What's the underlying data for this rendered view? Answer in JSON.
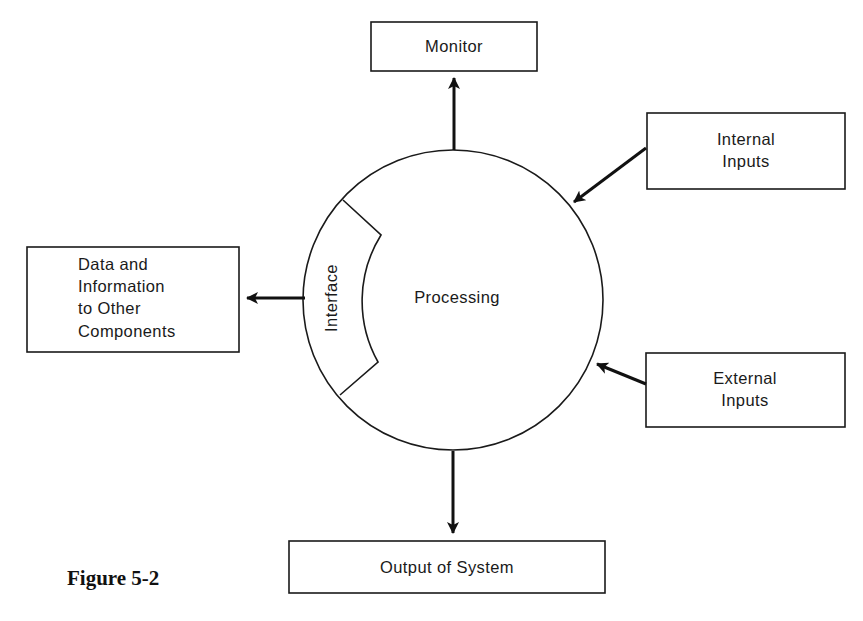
{
  "figure": {
    "caption": "Figure 5-2",
    "colors": {
      "ink": "#1a1a1a",
      "background": "#ffffff"
    }
  },
  "nodes": {
    "monitor": {
      "label": "Monitor"
    },
    "internal_inputs": {
      "line1": "Internal",
      "line2": "Inputs"
    },
    "external_inputs": {
      "line1": "External",
      "line2": "Inputs"
    },
    "data_out": {
      "line1": "Data and",
      "line2": "Information",
      "line3": "to Other",
      "line4": "Components"
    },
    "output": {
      "label": "Output of System"
    },
    "processing": {
      "label": "Processing"
    },
    "interface": {
      "label": "Interface"
    }
  },
  "edges": [
    {
      "from": "processing",
      "to": "monitor"
    },
    {
      "from": "internal_inputs",
      "to": "processing"
    },
    {
      "from": "external_inputs",
      "to": "processing"
    },
    {
      "from": "interface",
      "to": "data_out"
    },
    {
      "from": "processing",
      "to": "output"
    }
  ]
}
